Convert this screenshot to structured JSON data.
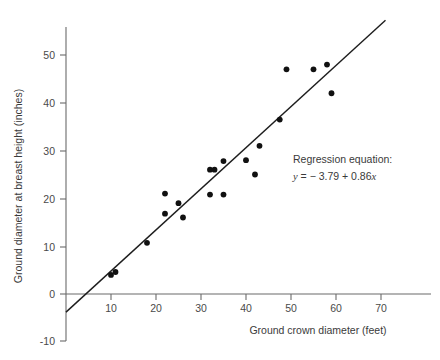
{
  "chart_data": {
    "type": "scatter",
    "title": "",
    "xlabel": "Ground crown diameter (feet)",
    "ylabel": "Ground diameter at breast height (inches)",
    "xlim": [
      0,
      78
    ],
    "ylim": [
      -10,
      57
    ],
    "xticks": [
      10,
      20,
      30,
      40,
      50,
      60,
      70
    ],
    "yticks": [
      -10,
      0,
      10,
      20,
      30,
      40,
      50
    ],
    "xtick_labels": [
      "10",
      "20",
      "30",
      "40",
      "50",
      "60",
      "70"
    ],
    "ytick_labels": [
      "-10",
      "0",
      "10",
      "20",
      "30",
      "40",
      "50"
    ],
    "grid": false,
    "legend": null,
    "marker": "filled-circle",
    "marker_color": "#111111",
    "x": [
      10,
      11,
      18,
      22,
      22,
      25,
      26,
      32,
      32,
      33,
      35,
      35,
      40,
      42,
      43,
      47.5,
      49,
      55,
      58,
      59
    ],
    "y": [
      4.0,
      4.6,
      10.7,
      16.8,
      21.0,
      19.0,
      16.0,
      20.8,
      26.0,
      26.0,
      20.8,
      27.8,
      28.0,
      25.0,
      31.0,
      36.5,
      47.0,
      47.0,
      48.0,
      42.0
    ],
    "points": [
      {
        "x": 10,
        "y": 4.0
      },
      {
        "x": 11,
        "y": 4.6
      },
      {
        "x": 18,
        "y": 10.7
      },
      {
        "x": 22,
        "y": 16.8
      },
      {
        "x": 22,
        "y": 21.0
      },
      {
        "x": 25,
        "y": 19.0
      },
      {
        "x": 26,
        "y": 16.0
      },
      {
        "x": 32,
        "y": 20.8
      },
      {
        "x": 32,
        "y": 26.0
      },
      {
        "x": 33,
        "y": 26.0
      },
      {
        "x": 35,
        "y": 20.8
      },
      {
        "x": 35,
        "y": 27.8
      },
      {
        "x": 40,
        "y": 28.0
      },
      {
        "x": 42,
        "y": 25.0
      },
      {
        "x": 43,
        "y": 31.0
      },
      {
        "x": 47.5,
        "y": 36.5
      },
      {
        "x": 49,
        "y": 47.0
      },
      {
        "x": 55,
        "y": 47.0
      },
      {
        "x": 58,
        "y": 48.0
      },
      {
        "x": 59,
        "y": 42.0
      }
    ],
    "fit_line": {
      "type": "linear-regression",
      "intercept": -3.79,
      "slope": 0.86,
      "x_start": 0,
      "x_end": 71,
      "color": "#1d1d1d"
    },
    "annotations": {
      "regression_caption": "Regression equation:",
      "regression_equation": "y = − 3.79 + 0.86x",
      "equation_parts": {
        "lhs": "y",
        "equals": "=",
        "intercept": "− 3.79",
        "plus": "+",
        "slope": "0.86",
        "variable": "x"
      }
    }
  },
  "axes": {
    "x_title": "Ground crown diameter (feet)",
    "y_title": "Ground diameter at breast height (inches)"
  },
  "colors": {
    "axis": "#6b6b6b",
    "line": "#1d1d1d",
    "marker": "#111111",
    "text": "#3a3a3a",
    "background": "#ffffff"
  }
}
